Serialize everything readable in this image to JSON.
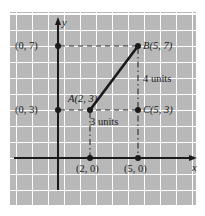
{
  "figure": {
    "background_color": "#ffffff",
    "grid_color": "#b8b8b8",
    "gridline_color": "#ffffff",
    "ink_color": "#1a1a1a"
  },
  "axes": {
    "x_label": "x",
    "y_label": "y",
    "unit_px": 16,
    "origin": {
      "x": 58,
      "y": 158
    }
  },
  "points": [
    {
      "id": "origin-y7",
      "label": "(0, 7)",
      "coords": [
        0,
        7
      ],
      "label_side": "left"
    },
    {
      "id": "point-b",
      "label": "B(5, 7)",
      "coords": [
        5,
        7
      ],
      "label_side": "right"
    },
    {
      "id": "point-a",
      "label": "A(2, 3)",
      "coords": [
        2,
        3
      ],
      "label_side": "above-left"
    },
    {
      "id": "origin-y3",
      "label": "(0, 3)",
      "coords": [
        0,
        3
      ],
      "label_side": "left"
    },
    {
      "id": "point-c",
      "label": "C(5, 3)",
      "coords": [
        5,
        3
      ],
      "label_side": "right"
    },
    {
      "id": "foot-x2",
      "label": "(2, 0)",
      "coords": [
        2,
        0
      ],
      "label_side": "below"
    },
    {
      "id": "foot-x5",
      "label": "(5, 0)",
      "coords": [
        5,
        0
      ],
      "label_side": "below"
    }
  ],
  "annotations": {
    "horizontal_distance": "3 units",
    "vertical_distance": "4 units"
  },
  "segments": [
    {
      "id": "segment-ab",
      "from": "A(2, 3)",
      "to": "B(5, 7)",
      "style": "solid",
      "weight": "thick"
    },
    {
      "id": "dashed-y7-to-b",
      "from": "(0, 7)",
      "to": "B(5, 7)",
      "style": "dashed"
    },
    {
      "id": "dashed-y3-to-c",
      "from": "(0, 3)",
      "to": "C(5, 3)",
      "style": "dashed"
    },
    {
      "id": "dashdot-b-to-x5",
      "from": "B(5, 7)",
      "to": "(5, 0)",
      "style": "dash-dot"
    },
    {
      "id": "dashdot-a-to-x2",
      "from": "A(2, 3)",
      "to": "(2, 0)",
      "style": "dash-dot"
    }
  ]
}
